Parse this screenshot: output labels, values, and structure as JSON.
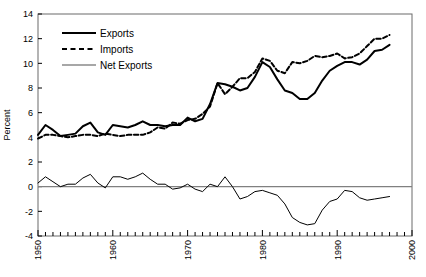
{
  "chart_data": {
    "type": "line",
    "title": "",
    "xlabel": "",
    "ylabel": "Percent",
    "xlim": [
      1950,
      2000
    ],
    "ylim": [
      -4,
      14
    ],
    "ytick_step": 2,
    "yticks": [
      -4,
      -2,
      0,
      2,
      4,
      6,
      8,
      10,
      12,
      14
    ],
    "xticks_labeled": [
      1950,
      1960,
      1970,
      1980,
      1990,
      2000
    ],
    "xtick_minor_step": 1,
    "grid": false,
    "zero_reference_line": true,
    "zero_reference_color": "#808080",
    "legend_position": "top-left",
    "legend": [
      "Exports",
      "Imports",
      "Net Exports"
    ],
    "x": [
      1950,
      1951,
      1952,
      1953,
      1954,
      1955,
      1956,
      1957,
      1958,
      1959,
      1960,
      1961,
      1962,
      1963,
      1964,
      1965,
      1966,
      1967,
      1968,
      1969,
      1970,
      1971,
      1972,
      1973,
      1974,
      1975,
      1976,
      1977,
      1978,
      1979,
      1980,
      1981,
      1982,
      1983,
      1984,
      1985,
      1986,
      1987,
      1988,
      1989,
      1990,
      1991,
      1992,
      1993,
      1994,
      1995,
      1996,
      1997
    ],
    "series": [
      {
        "name": "Exports",
        "color": "#000000",
        "style": "solid",
        "width": 2,
        "values": [
          4.2,
          5.0,
          4.6,
          4.1,
          4.2,
          4.3,
          4.9,
          5.2,
          4.4,
          4.2,
          5.0,
          4.9,
          4.8,
          5.0,
          5.3,
          5.0,
          5.0,
          4.9,
          5.0,
          5.0,
          5.6,
          5.3,
          5.5,
          6.7,
          8.4,
          8.3,
          8.1,
          7.8,
          8.0,
          8.9,
          10.1,
          9.7,
          8.7,
          7.8,
          7.6,
          7.1,
          7.1,
          7.6,
          8.6,
          9.4,
          9.8,
          10.1,
          10.1,
          9.9,
          10.3,
          11.0,
          11.1,
          11.5
        ]
      },
      {
        "name": "Imports",
        "color": "#000000",
        "style": "dashed",
        "width": 2,
        "values": [
          3.9,
          4.2,
          4.2,
          4.1,
          4.0,
          4.1,
          4.2,
          4.2,
          4.1,
          4.3,
          4.2,
          4.1,
          4.2,
          4.2,
          4.2,
          4.4,
          4.8,
          4.7,
          5.2,
          5.1,
          5.4,
          5.5,
          5.9,
          6.5,
          8.4,
          7.5,
          8.1,
          8.8,
          8.8,
          9.3,
          10.4,
          10.2,
          9.4,
          9.2,
          10.1,
          10.0,
          10.2,
          10.6,
          10.5,
          10.6,
          10.8,
          10.4,
          10.5,
          10.8,
          11.4,
          12.0,
          12.0,
          12.3
        ]
      },
      {
        "name": "Net Exports",
        "color": "#000000",
        "style": "solid",
        "width": 1,
        "values": [
          0.3,
          0.8,
          0.4,
          0.0,
          0.2,
          0.2,
          0.7,
          1.0,
          0.3,
          -0.1,
          0.8,
          0.8,
          0.6,
          0.8,
          1.1,
          0.6,
          0.2,
          0.2,
          -0.2,
          -0.1,
          0.2,
          -0.2,
          -0.4,
          0.2,
          0.0,
          0.8,
          0.0,
          -1.0,
          -0.8,
          -0.4,
          -0.3,
          -0.5,
          -0.7,
          -1.4,
          -2.5,
          -2.9,
          -3.1,
          -3.0,
          -1.9,
          -1.2,
          -1.0,
          -0.3,
          -0.4,
          -0.9,
          -1.1,
          -1.0,
          -0.9,
          -0.8
        ]
      }
    ]
  },
  "axis": {
    "ylabel": "Percent",
    "ytick_labels": [
      "14",
      "12",
      "10",
      "8",
      "6",
      "4",
      "2",
      "0",
      "-2",
      "-4"
    ],
    "xtick_labels": [
      "1950",
      "1960",
      "1970",
      "1980",
      "1990",
      "2000"
    ]
  },
  "legend": {
    "items": [
      {
        "label": "Exports",
        "marker": "thick-solid-line"
      },
      {
        "label": "Imports",
        "marker": "dashed-line"
      },
      {
        "label": "Net Exports",
        "marker": "thin-gray-line"
      }
    ]
  }
}
